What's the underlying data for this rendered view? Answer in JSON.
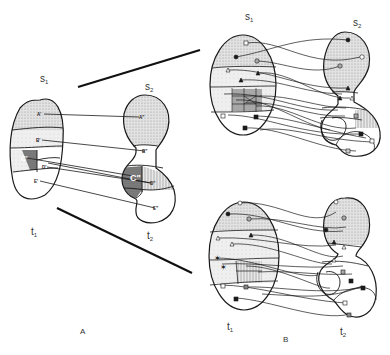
{
  "panel_a": {
    "label": "A",
    "top_s1": "s",
    "top_s1_sub": "1",
    "top_s2": "s",
    "top_s2_sub": "2",
    "bottom_t1": "t",
    "bottom_t1_sub": "1",
    "bottom_t2": "t",
    "bottom_t2_sub": "2",
    "regions_left": [
      "A'",
      "B'",
      "C'",
      "D'",
      "E'"
    ],
    "regions_right": [
      "A\"",
      "B\"",
      "C\"",
      "D\"",
      "E\""
    ]
  },
  "panel_b": {
    "label": "B",
    "top_s1": "s",
    "top_s1_sub": "1",
    "top_s2": "s",
    "top_s2_sub": "2",
    "bottom_t1": "t",
    "bottom_t1_sub": "1",
    "bottom_t2": "t",
    "bottom_t2_sub": "2"
  },
  "colors": {
    "ink": "#1a1a1a",
    "stipple": "#d8d8d8",
    "light_shade": "#ececec",
    "dark_shade": "#7a7a7a"
  }
}
